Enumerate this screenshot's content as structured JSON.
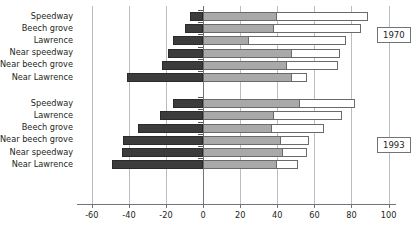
{
  "chart_data": {
    "type": "bar",
    "orientation": "horizontal",
    "title": "",
    "xlabel": "",
    "ylabel": "",
    "xlim": [
      -68,
      104
    ],
    "xticks": [
      -60,
      -40,
      -20,
      0,
      20,
      40,
      60,
      80,
      100
    ],
    "grid": true,
    "legend": null,
    "stacked": true,
    "segment_names": [
      "negative",
      "middle",
      "outer"
    ],
    "segment_colors": [
      "#3c3c3c",
      "#a9a9a9",
      "#ffffff"
    ],
    "groups": [
      {
        "label": "1970",
        "categories": [
          "Speedway",
          "Beech grove",
          "Lawrence",
          "Near speedway",
          "Near beech grove",
          "Near Lawrence"
        ],
        "negative": [
          -7,
          -10,
          -16,
          -19,
          -22,
          -41
        ],
        "middle": [
          40,
          38,
          25,
          48,
          45,
          48
        ],
        "outer": [
          89,
          85,
          77,
          74,
          73,
          56
        ]
      },
      {
        "label": "1993",
        "categories": [
          "Speedway",
          "Lawrence",
          "Beech grove",
          "Near beech grove",
          "Near speedway",
          "Near Lawrence"
        ],
        "negative": [
          -16,
          -23,
          -35,
          -43,
          -44,
          -49
        ],
        "middle": [
          52,
          38,
          37,
          42,
          43,
          40
        ],
        "outer": [
          82,
          75,
          65,
          57,
          56,
          51
        ]
      }
    ]
  },
  "axis": {
    "tick_labels": [
      "-60",
      "-40",
      "-20",
      "0",
      "20",
      "40",
      "60",
      "80",
      "100"
    ]
  },
  "annotations": {
    "year_1970": "1970",
    "year_1993": "1993"
  }
}
